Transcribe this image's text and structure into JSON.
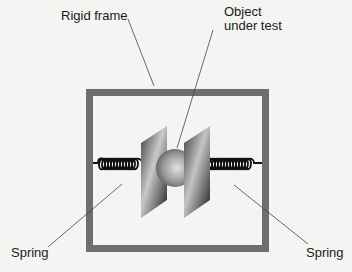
{
  "labels": {
    "frame": "Rigid frame",
    "object_line1": "Object",
    "object_line2": "under test",
    "spring_left": "Spring",
    "spring_right": "Spring"
  },
  "colors": {
    "background": "#f4f4f2",
    "frame": "#6e6e6e",
    "text": "#1a1a1a",
    "leader": "#444444"
  }
}
